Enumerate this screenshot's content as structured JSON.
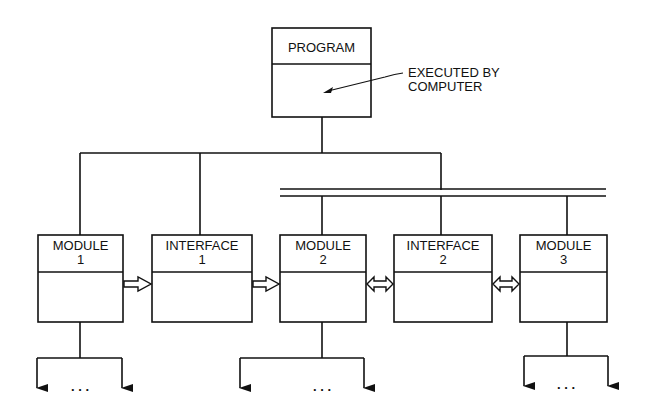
{
  "program": {
    "title": "PROGRAM"
  },
  "annotation": {
    "line1": "EXECUTED BY",
    "line2": "COMPUTER"
  },
  "boxes": [
    {
      "title": "MODULE",
      "number": "1"
    },
    {
      "title": "INTERFACE",
      "number": "1"
    },
    {
      "title": "MODULE",
      "number": "2"
    },
    {
      "title": "INTERFACE",
      "number": "2"
    },
    {
      "title": "MODULE",
      "number": "3"
    }
  ],
  "ellipsis": ". . .",
  "colors": {
    "ink": "#111111",
    "background": "#ffffff"
  }
}
